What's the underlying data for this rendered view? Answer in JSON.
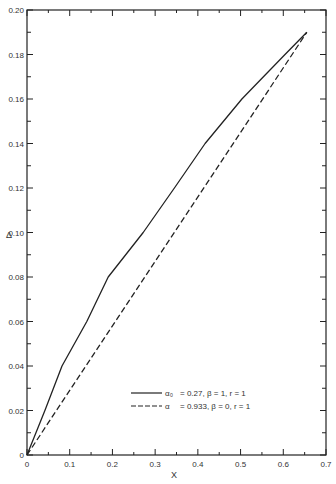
{
  "chart_data": {
    "type": "line",
    "title": "",
    "xlabel": "X",
    "ylabel": "Δ",
    "xlim": [
      0,
      0.7
    ],
    "ylim": [
      0,
      0.2
    ],
    "grid": false,
    "legend_position": "lower right",
    "x_ticks": [
      "0",
      "0.1",
      "0.2",
      "0.3",
      "0.4",
      "0.5",
      "0.6",
      "0.7"
    ],
    "y_ticks": [
      "0",
      "0.02",
      "0.04",
      "0.06",
      "0.08",
      "0.10",
      "0.12",
      "0.14",
      "0.16",
      "0.18",
      "0.20"
    ],
    "series": [
      {
        "name": "α₀ = 0.27, β = 1, r = 1",
        "style": "solid",
        "x": [
          0,
          0.042,
          0.082,
          0.14,
          0.19,
          0.272,
          0.345,
          0.417,
          0.503,
          0.604,
          0.655
        ],
        "y": [
          0,
          0.02,
          0.04,
          0.06,
          0.08,
          0.1,
          0.12,
          0.14,
          0.16,
          0.18,
          0.19
        ]
      },
      {
        "name": "α = 0.933, β = 0, r = 1",
        "style": "dashed",
        "x": [
          0,
          0.655
        ],
        "y": [
          0,
          0.19
        ]
      }
    ]
  },
  "labels": {
    "xlabel": "X",
    "ylabel": "Δ",
    "legend": [
      {
        "symbol": "α₀",
        "text": "= 0.27,  β = 1,  r = 1"
      },
      {
        "symbol": "α",
        "text": "= 0.933,  β = 0,  r = 1"
      }
    ]
  }
}
